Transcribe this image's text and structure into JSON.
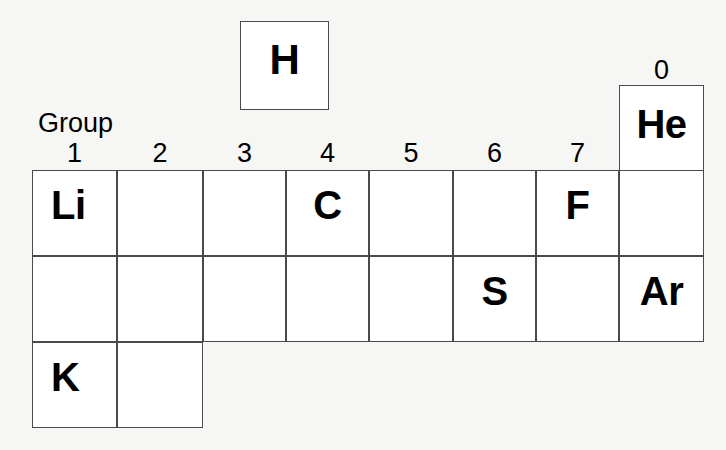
{
  "figure": {
    "group_label": "Group",
    "group_zero_label": "0",
    "group_numbers": [
      "1",
      "2",
      "3",
      "4",
      "5",
      "6",
      "7"
    ],
    "colors": {
      "background": "#f6f6f4",
      "cell_fill": "#ffffff",
      "cell_border": "#4a4a4a",
      "text": "#000000"
    }
  },
  "standalone": {
    "hydrogen": {
      "symbol": "H"
    },
    "helium": {
      "symbol": "He"
    }
  },
  "grid": {
    "rows": [
      {
        "period": 2,
        "cells": [
          {
            "group": "1",
            "symbol": "Li"
          },
          {
            "group": "2",
            "symbol": ""
          },
          {
            "group": "3",
            "symbol": ""
          },
          {
            "group": "4",
            "symbol": "C"
          },
          {
            "group": "5",
            "symbol": ""
          },
          {
            "group": "6",
            "symbol": ""
          },
          {
            "group": "7",
            "symbol": "F"
          },
          {
            "group": "0",
            "symbol": ""
          }
        ]
      },
      {
        "period": 3,
        "cells": [
          {
            "group": "1",
            "symbol": ""
          },
          {
            "group": "2",
            "symbol": ""
          },
          {
            "group": "3",
            "symbol": ""
          },
          {
            "group": "4",
            "symbol": ""
          },
          {
            "group": "5",
            "symbol": ""
          },
          {
            "group": "6",
            "symbol": "S"
          },
          {
            "group": "7",
            "symbol": ""
          },
          {
            "group": "0",
            "symbol": "Ar"
          }
        ]
      },
      {
        "period": 4,
        "cells": [
          {
            "group": "1",
            "symbol": "K"
          },
          {
            "group": "2",
            "symbol": ""
          }
        ]
      }
    ]
  },
  "chart_data": {
    "type": "table",
    "xlabel": "Group",
    "ylabel": "",
    "categories": [
      "1",
      "2",
      "3",
      "4",
      "5",
      "6",
      "7",
      "0"
    ],
    "rows": [
      [
        "Li",
        "",
        "",
        "C",
        "",
        "",
        "F",
        ""
      ],
      [
        "",
        "",
        "",
        "",
        "",
        "S",
        "",
        "Ar"
      ],
      [
        "K",
        "",
        null,
        null,
        null,
        null,
        null,
        null
      ]
    ],
    "detached_cells": [
      {
        "symbol": "H",
        "group": null,
        "period": 1
      },
      {
        "symbol": "He",
        "group": "0",
        "period": 1
      }
    ],
    "grid": true,
    "legend": "none"
  }
}
